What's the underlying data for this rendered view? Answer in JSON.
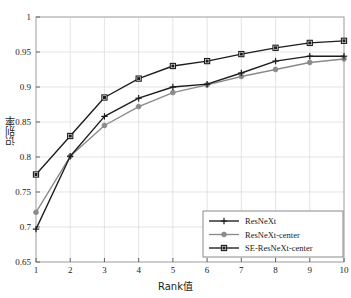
{
  "chart_data": {
    "type": "line",
    "title": "",
    "xlabel": "Rank值",
    "ylabel": "识别率",
    "x": [
      1,
      2,
      3,
      4,
      5,
      6,
      7,
      8,
      9,
      10
    ],
    "xticklabels": [
      "1",
      "2",
      "3",
      "4",
      "5",
      "6",
      "7",
      "8",
      "9",
      "10"
    ],
    "yticklabels": [
      "0.65",
      "0.7",
      "0.75",
      "0.8",
      "0.85",
      "0.9",
      "0.95",
      "1"
    ],
    "yticks": [
      0.65,
      0.7,
      0.75,
      0.8,
      0.85,
      0.9,
      0.95,
      1
    ],
    "xlim": [
      1,
      10
    ],
    "ylim": [
      0.65,
      1
    ],
    "grid": true,
    "legend_position": "lower right",
    "series": [
      {
        "name": "ResNeXt",
        "marker": "plus",
        "color": "#1c1c1c",
        "values": [
          0.697,
          0.801,
          0.858,
          0.884,
          0.9,
          0.904,
          0.92,
          0.937,
          0.944,
          0.944
        ]
      },
      {
        "name": "ResNeXt-center",
        "marker": "circle",
        "color": "#8a8a8a",
        "values": [
          0.721,
          0.801,
          0.845,
          0.872,
          0.892,
          0.903,
          0.915,
          0.925,
          0.935,
          0.94
        ]
      },
      {
        "name": "SE-ResNeXt-center",
        "marker": "square",
        "color": "#1c1c1c",
        "values": [
          0.775,
          0.83,
          0.885,
          0.912,
          0.93,
          0.937,
          0.947,
          0.956,
          0.963,
          0.966
        ]
      }
    ]
  },
  "axes": {
    "frame_color": "#b0b0b0",
    "grid_color": "#d9d9d9",
    "tick_color": "#555555"
  },
  "legend": {
    "entries": [
      "ResNeXt",
      "ResNeXt-center",
      "SE-ResNeXt-center"
    ],
    "border_color": "#8a8a8a",
    "background": "#ffffff"
  }
}
